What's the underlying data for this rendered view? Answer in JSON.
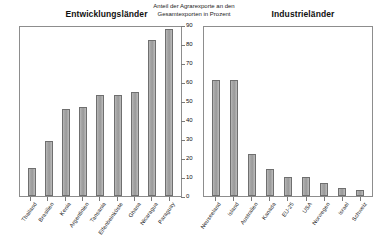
{
  "chart_data": {
    "type": "bar",
    "title": "Anteil der Agrarexporte an den Gesamtexporten in Prozent",
    "title_lines": [
      "Anteil der Agrarexporte an den",
      "Gesamtexporten in Prozent"
    ],
    "xlabel": "",
    "ylabel": "",
    "ylim": [
      0,
      90
    ],
    "yticks": [
      0,
      10,
      20,
      30,
      40,
      50,
      60,
      70,
      80,
      90
    ],
    "grid": false,
    "legend": "none",
    "bar_color": "#a8a8a8",
    "bar_edge_color": "#6f6f6f",
    "panels": [
      {
        "name": "left",
        "title": "Entwicklungsländer",
        "categories": [
          "Thailand",
          "Brasilien",
          "Kenia",
          "Argentinien",
          "Tansania",
          "Elfenbeinküste",
          "Ghana",
          "Nicaragua",
          "Paraguay"
        ],
        "values": [
          15,
          29,
          46,
          47,
          53,
          53,
          55,
          82,
          88
        ]
      },
      {
        "name": "right",
        "title": "Industrieländer",
        "categories": [
          "Neuseeland",
          "Island",
          "Australien",
          "Kanada",
          "EU-25",
          "USA",
          "Norwegen",
          "Israel",
          "Schweiz"
        ],
        "values": [
          61,
          61,
          22,
          14,
          10,
          10,
          7,
          4,
          3
        ]
      }
    ]
  }
}
